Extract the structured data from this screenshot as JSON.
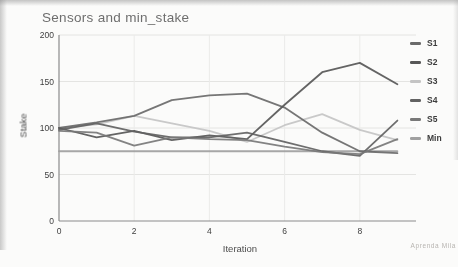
{
  "title": "Sensors and min_stake",
  "watermark": "Aprenda Mila",
  "chart_data": {
    "type": "line",
    "title": "Sensors and min_stake",
    "xlabel": "Iteration",
    "ylabel": "Stake",
    "x": [
      0,
      1,
      2,
      3,
      4,
      5,
      6,
      7,
      8,
      9
    ],
    "xlim": [
      0,
      9.5
    ],
    "ylim": [
      0,
      200
    ],
    "x_ticks": [
      0,
      2,
      4,
      6,
      8
    ],
    "y_ticks": [
      0,
      50,
      100,
      150,
      200
    ],
    "grid": true,
    "legend_position": "right",
    "series": [
      {
        "name": "S1",
        "color": "#6a6a6a",
        "values": [
          100,
          106,
          113,
          130,
          135,
          137,
          122,
          95,
          75,
          73
        ]
      },
      {
        "name": "S2",
        "color": "#575757",
        "values": [
          100,
          90,
          97,
          87,
          92,
          88,
          125,
          160,
          170,
          147
        ]
      },
      {
        "name": "S3",
        "color": "#c4c4c4",
        "values": [
          100,
          104,
          113,
          105,
          97,
          85,
          103,
          115,
          98,
          87
        ]
      },
      {
        "name": "S4",
        "color": "#626262",
        "values": [
          98,
          105,
          96,
          90,
          90,
          95,
          85,
          75,
          70,
          108
        ]
      },
      {
        "name": "S5",
        "color": "#787878",
        "values": [
          97,
          95,
          81,
          90,
          88,
          87,
          80,
          74,
          72,
          88
        ]
      },
      {
        "name": "Min",
        "color": "#a0a0a0",
        "values": [
          75,
          75,
          75,
          75,
          75,
          75,
          75,
          75,
          75,
          75
        ]
      }
    ]
  },
  "axes": {
    "y_tick_labels": [
      "200",
      "150",
      "100",
      "50",
      "0"
    ],
    "x_tick_labels": [
      "0",
      "2",
      "4",
      "6",
      "8"
    ]
  }
}
